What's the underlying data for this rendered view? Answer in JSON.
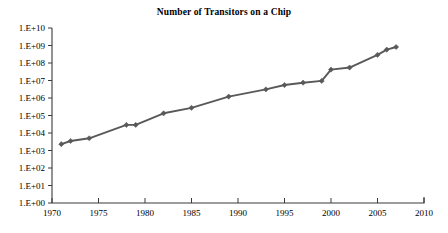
{
  "chart_data": {
    "type": "line",
    "title": "Number of Transitors on a Chip",
    "xlabel": "",
    "ylabel": "",
    "xlim": [
      1970,
      2010
    ],
    "ylim": [
      1,
      10000000000
    ],
    "yscale": "log",
    "grid": false,
    "legend": "none",
    "line_color": "#595959",
    "marker": "diamond",
    "x_ticks": [
      "1970",
      "1975",
      "1980",
      "1985",
      "1990",
      "1995",
      "2000",
      "2005",
      "2010"
    ],
    "x_tick_values": [
      1970,
      1975,
      1980,
      1985,
      1990,
      1995,
      2000,
      2005,
      2010
    ],
    "y_ticks": [
      "1.E+00",
      "1.E+01",
      "1.E+02",
      "1.E+03",
      "1.E+04",
      "1.E+05",
      "1.E+06",
      "1.E+07",
      "1.E+08",
      "1.E+09",
      "1.E+10"
    ],
    "y_tick_values": [
      1,
      10,
      100,
      1000,
      10000,
      100000,
      1000000,
      10000000,
      100000000,
      1000000000,
      10000000000
    ],
    "series": [
      {
        "name": "Transistors",
        "x": [
          1971,
          1972,
          1974,
          1978,
          1979,
          1982,
          1985,
          1989,
          1993,
          1995,
          1997,
          1999,
          2000,
          2002,
          2005,
          2006,
          2007
        ],
        "values": [
          2300,
          3500,
          5000,
          29000,
          29000,
          134000,
          275000,
          1200000,
          3100000,
          5500000,
          7500000,
          9500000,
          42000000,
          55000000,
          291000000,
          582000000,
          820000000
        ]
      }
    ]
  },
  "accessibility": {
    "chart_role": "line-chart",
    "axis_color": "#3a3a3a"
  }
}
